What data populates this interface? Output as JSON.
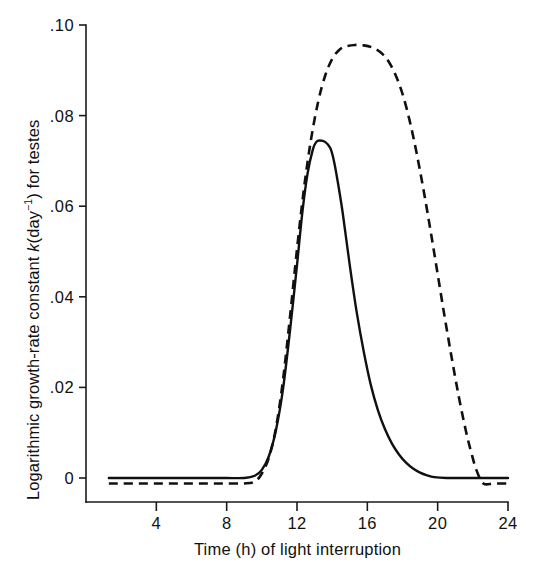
{
  "chart_data": {
    "type": "line",
    "title": "",
    "xlabel": "Time (h) of light interruption",
    "ylabel": "Logarithmic growth-rate constant k(day⁻¹) for testes",
    "ylabel_parts": {
      "prefix": "Logarithmic growth-rate constant ",
      "symbol": "k",
      "unit_open": "(day",
      "unit_exponent": "−1",
      "unit_close": ") for testes"
    },
    "xlim": [
      0,
      24
    ],
    "ylim": [
      0,
      0.1
    ],
    "grid": false,
    "legend": "none",
    "xticks": [
      4,
      8,
      12,
      16,
      20,
      24
    ],
    "xtick_labels": [
      "4",
      "8",
      "12",
      "16",
      "20",
      "24"
    ],
    "yticks": [
      0,
      0.02,
      0.04,
      0.06,
      0.08,
      0.1
    ],
    "ytick_labels": [
      "0",
      ".02",
      ".04",
      ".06",
      ".08",
      ".10"
    ],
    "series": [
      {
        "name": "solid-curve",
        "style": "solid",
        "color": "#101010",
        "x": [
          1.3,
          2.0,
          3.0,
          4.0,
          5.0,
          6.0,
          7.0,
          8.0,
          9.0,
          9.6,
          10.0,
          10.4,
          10.8,
          11.2,
          11.6,
          12.0,
          12.3,
          12.6,
          12.9,
          13.1,
          13.3,
          13.6,
          13.9,
          14.1,
          14.3,
          14.6,
          15.0,
          15.4,
          15.8,
          16.2,
          16.6,
          17.0,
          17.4,
          17.8,
          18.2,
          18.6,
          19.0,
          19.4,
          19.8,
          20.5,
          21.5,
          22.5,
          23.2,
          24.0
        ],
        "y": [
          0.0,
          0.0,
          0.0,
          0.0,
          0.0,
          0.0,
          0.0,
          0.0,
          0.0,
          0.0005,
          0.0018,
          0.0048,
          0.0105,
          0.0195,
          0.0325,
          0.047,
          0.0585,
          0.0672,
          0.0725,
          0.0742,
          0.0745,
          0.0742,
          0.0728,
          0.07,
          0.0658,
          0.0585,
          0.047,
          0.0365,
          0.0278,
          0.0205,
          0.015,
          0.0108,
          0.0076,
          0.0052,
          0.0034,
          0.0021,
          0.0012,
          0.0006,
          0.0002,
          0.0,
          0.0,
          0.0,
          0.0,
          0.0
        ]
      },
      {
        "name": "dashed-curve",
        "style": "dashed",
        "color": "#101010",
        "x": [
          1.3,
          2.0,
          3.0,
          4.0,
          5.0,
          6.0,
          7.0,
          8.0,
          9.0,
          9.6,
          10.0,
          10.4,
          10.8,
          11.2,
          11.6,
          12.0,
          12.4,
          12.8,
          13.2,
          13.6,
          14.0,
          14.4,
          14.8,
          15.3,
          15.8,
          16.3,
          16.8,
          17.2,
          17.6,
          18.0,
          18.4,
          18.8,
          19.2,
          19.6,
          20.0,
          20.4,
          20.8,
          21.2,
          21.6,
          21.9,
          22.2,
          22.6,
          23.2,
          24.0
        ],
        "y": [
          -0.0012,
          -0.0012,
          -0.0012,
          -0.0012,
          -0.0012,
          -0.0012,
          -0.0012,
          -0.0012,
          -0.0012,
          -0.0008,
          0.001,
          0.0045,
          0.011,
          0.0215,
          0.0355,
          0.0505,
          0.064,
          0.0748,
          0.083,
          0.0888,
          0.0925,
          0.0945,
          0.0953,
          0.0956,
          0.0955,
          0.095,
          0.0938,
          0.092,
          0.089,
          0.0848,
          0.079,
          0.0718,
          0.0635,
          0.0545,
          0.045,
          0.0355,
          0.0265,
          0.018,
          0.0105,
          0.0058,
          0.0018,
          -0.0012,
          -0.0012,
          -0.0012
        ]
      }
    ]
  },
  "axes": {
    "y_axis_label_name": "y-axis-title",
    "x_axis_label_name": "x-axis-title"
  }
}
